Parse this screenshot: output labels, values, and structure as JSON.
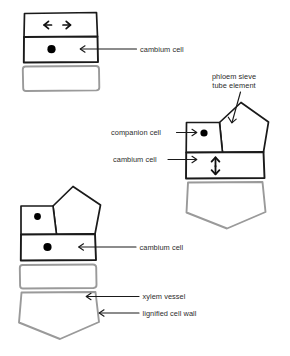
{
  "figure": {
    "colors": {
      "cell_outline_active": "#1a1a1a",
      "cell_outline_differentiated": "#9a9a9a",
      "nucleus": "#000000",
      "label_text": "#2b2b2b",
      "leader_line": "#1a1a1a",
      "background": "#ffffff"
    }
  },
  "labels": {
    "cambium_cell_top": "cambium cell",
    "phloem_sieve_tube_element_line1": "phloem sieve",
    "phloem_sieve_tube_element_line2": "tube element",
    "companion_cell": "companion cell",
    "cambium_cell_middle": "cambium cell",
    "cambium_cell_bottom": "cambium cell",
    "xylem_vessel": "xylem vessel",
    "lignified_cell_wall": "lignified cell wall"
  },
  "diagrams": [
    {
      "id": "top-left",
      "name": "cambium cell dividing anticlinally",
      "cells": [
        {
          "shape": "rectangle",
          "outline": "black",
          "content": "horizontal-double-arrow"
        },
        {
          "shape": "rectangle",
          "outline": "black",
          "content": "nucleus"
        },
        {
          "shape": "rectangle",
          "outline": "gray",
          "content": "none"
        }
      ]
    },
    {
      "id": "middle-right",
      "name": "phloem differentiation",
      "cells": [
        {
          "shape": "pentagon",
          "outline": "black",
          "content": "none"
        },
        {
          "shape": "rectangle",
          "outline": "black",
          "content": "nucleus"
        },
        {
          "shape": "rectangle",
          "outline": "black",
          "content": "vertical-double-arrow"
        },
        {
          "shape": "pentagon",
          "outline": "gray",
          "content": "none"
        }
      ]
    },
    {
      "id": "bottom-left",
      "name": "xylem differentiation",
      "cells": [
        {
          "shape": "pentagon",
          "outline": "black",
          "content": "none"
        },
        {
          "shape": "rectangle",
          "outline": "black",
          "content": "nucleus"
        },
        {
          "shape": "rectangle",
          "outline": "black",
          "content": "nucleus"
        },
        {
          "shape": "rectangle",
          "outline": "gray",
          "content": "none"
        },
        {
          "shape": "pentagon",
          "outline": "gray",
          "content": "none"
        }
      ]
    }
  ]
}
